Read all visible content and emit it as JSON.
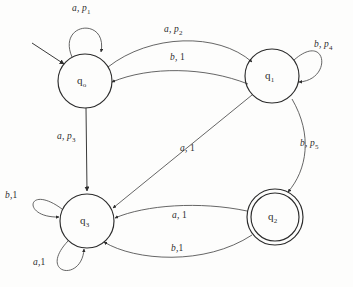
{
  "figure": {
    "type": "finite-state-machine-diagram",
    "background_color": "#fdfdfc",
    "stroke_color": "#2b2b2b"
  },
  "states": [
    {
      "id": "q0",
      "label": "q",
      "subscript": "o",
      "accepting": false,
      "is_start": true,
      "cx": 85,
      "cy": 81,
      "r": 27
    },
    {
      "id": "q1",
      "label": "q",
      "subscript": "1",
      "accepting": false,
      "is_start": false,
      "cx": 272,
      "cy": 76,
      "r": 27
    },
    {
      "id": "q2",
      "label": "q",
      "subscript": "2",
      "accepting": true,
      "is_start": false,
      "cx": 275,
      "cy": 217,
      "r": 28
    },
    {
      "id": "q3",
      "label": "q",
      "subscript": "3",
      "accepting": false,
      "is_start": false,
      "cx": 87,
      "cy": 221,
      "r": 27
    }
  ],
  "transitions": [
    {
      "id": "t-q0-q0",
      "from": "q0",
      "to": "q0",
      "symbol": "a",
      "weight": "p",
      "weight_sub": "1",
      "label": "a, p1",
      "kind": "self-loop"
    },
    {
      "id": "t-q0-q1",
      "from": "q0",
      "to": "q1",
      "symbol": "a",
      "weight": "p",
      "weight_sub": "2",
      "label": "a, p2",
      "kind": "curve"
    },
    {
      "id": "t-q1-q0",
      "from": "q1",
      "to": "q0",
      "symbol": "b",
      "weight": "1",
      "weight_sub": "",
      "label": "b, 1",
      "kind": "curve"
    },
    {
      "id": "t-q1-q1",
      "from": "q1",
      "to": "q1",
      "symbol": "b",
      "weight": "p",
      "weight_sub": "4",
      "label": "b, p4",
      "kind": "self-loop"
    },
    {
      "id": "t-q0-q3",
      "from": "q0",
      "to": "q3",
      "symbol": "a",
      "weight": "p",
      "weight_sub": "3",
      "label": "a, p3",
      "kind": "straight"
    },
    {
      "id": "t-q1-q3",
      "from": "q1",
      "to": "q3",
      "symbol": "a",
      "weight": "1",
      "weight_sub": "",
      "label": "a, 1",
      "kind": "straight"
    },
    {
      "id": "t-q1-q2",
      "from": "q1",
      "to": "q2",
      "symbol": "b",
      "weight": "p",
      "weight_sub": "5",
      "label": "b, p5",
      "kind": "curve"
    },
    {
      "id": "t-q3-q3-b",
      "from": "q3",
      "to": "q3",
      "symbol": "b",
      "weight": "1",
      "weight_sub": "",
      "label": "b,1",
      "kind": "self-loop"
    },
    {
      "id": "t-q3-q3-a",
      "from": "q3",
      "to": "q3",
      "symbol": "a",
      "weight": "1",
      "weight_sub": "",
      "label": "a,1",
      "kind": "self-loop"
    },
    {
      "id": "t-q2-q3-a",
      "from": "q2",
      "to": "q3",
      "symbol": "a",
      "weight": "1",
      "weight_sub": "",
      "label": "a, 1",
      "kind": "curve"
    },
    {
      "id": "t-q2-q3-b",
      "from": "q2",
      "to": "q3",
      "symbol": "b",
      "weight": "1",
      "weight_sub": "",
      "label": "b,1",
      "kind": "curve"
    }
  ],
  "labels": {
    "q0_loop": {
      "sym": "a, ",
      "p": "p",
      "sub": "1"
    },
    "q0_to_q1": {
      "sym": "a, ",
      "p": "p",
      "sub": "2"
    },
    "q1_to_q0": {
      "sym": "b, ",
      "p": "1",
      "sub": ""
    },
    "q1_loop": {
      "sym": "b, ",
      "p": "p",
      "sub": "4"
    },
    "q0_to_q3": {
      "sym": "a, ",
      "p": "p",
      "sub": "3"
    },
    "q1_to_q3": {
      "sym": "a, ",
      "p": "1",
      "sub": ""
    },
    "q1_to_q2": {
      "sym": "b, ",
      "p": "p",
      "sub": "5"
    },
    "q3_loop_b": {
      "sym": "b,",
      "p": "1",
      "sub": ""
    },
    "q3_loop_a": {
      "sym": "a,",
      "p": "1",
      "sub": ""
    },
    "q2_to_q3_a": {
      "sym": "a, ",
      "p": "1",
      "sub": ""
    },
    "q2_to_q3_b": {
      "sym": "b,",
      "p": "1",
      "sub": ""
    }
  }
}
